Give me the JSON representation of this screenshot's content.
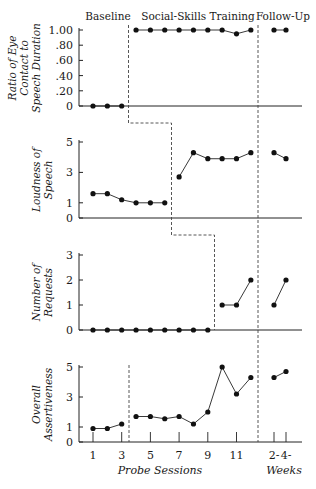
{
  "chart_data": {
    "type": "line",
    "title": "",
    "phases": [
      "Baseline",
      "Social-Skills Training",
      "Follow-Up"
    ],
    "xlabel": "Probe Sessions",
    "xlabel_followup": "Weeks",
    "x_tick_labels": [
      "1",
      "3",
      "5",
      "7",
      "9",
      "11"
    ],
    "followup_tick_labels": [
      "2-",
      "4-"
    ],
    "sessions": [
      1,
      2,
      3,
      4,
      5,
      6,
      7,
      8,
      9,
      10,
      11,
      12
    ],
    "followup_weeks": [
      2,
      4
    ],
    "panels": [
      {
        "ylabel": [
          "Ratio of Eye",
          "Contact to",
          "Speech Duration"
        ],
        "ylim": [
          0,
          1.0
        ],
        "yticks": [
          "0",
          ".20",
          ".40",
          ".60",
          ".80",
          "1.00"
        ],
        "ytick_values": [
          0,
          0.2,
          0.4,
          0.6,
          0.8,
          1.0
        ],
        "baseline_end_after_session": 3,
        "values": [
          0,
          0,
          0,
          1.0,
          1.0,
          1.0,
          1.0,
          1.0,
          1.0,
          1.0,
          0.95,
          1.0
        ],
        "followup": [
          1.0,
          1.0
        ]
      },
      {
        "ylabel": [
          "Loudness of",
          "Speech"
        ],
        "ylim": [
          0,
          5
        ],
        "yticks": [
          "0",
          "1",
          "3",
          "5"
        ],
        "ytick_values": [
          0,
          1,
          3,
          5
        ],
        "baseline_end_after_session": 6,
        "values": [
          1.6,
          1.6,
          1.2,
          1.0,
          1.0,
          1.0,
          2.7,
          4.3,
          3.9,
          3.9,
          3.9,
          4.3
        ],
        "followup": [
          4.3,
          3.9
        ]
      },
      {
        "ylabel": [
          "Number of",
          "Requests"
        ],
        "ylim": [
          0,
          3
        ],
        "yticks": [
          "0",
          "1",
          "2",
          "3"
        ],
        "ytick_values": [
          0,
          1,
          2,
          3
        ],
        "baseline_end_after_session": 9,
        "values": [
          0,
          0,
          0,
          0,
          0,
          0,
          0,
          0,
          0,
          1,
          1,
          2
        ],
        "followup": [
          1,
          2
        ]
      },
      {
        "ylabel": [
          "Overall",
          "Assertiveness"
        ],
        "ylim": [
          0,
          5
        ],
        "yticks": [
          "0",
          "1",
          "3",
          "5"
        ],
        "ytick_values": [
          0,
          1,
          3,
          5
        ],
        "baseline_end_after_session": 3,
        "values": [
          0.9,
          0.9,
          1.2,
          1.7,
          1.7,
          1.55,
          1.7,
          1.2,
          2.0,
          5.0,
          3.2,
          4.3
        ],
        "followup": [
          4.3,
          4.7
        ]
      }
    ]
  }
}
